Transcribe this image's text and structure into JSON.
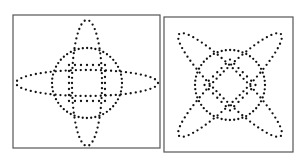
{
  "figure": {
    "panels": [
      {
        "id": "left",
        "description": "dotted circle with inner dotted square, crossed by horizontal and vertical dotted ellipses",
        "frame": {
          "x": 13,
          "y": 15,
          "w": 147,
          "h": 133
        },
        "center": [
          87,
          83
        ],
        "shapes": {
          "circle_r": 35,
          "vertical_ellipse": {
            "rx": 15,
            "ry": 63,
            "angle": 0
          },
          "horizontal_ellipse": {
            "rx": 71,
            "ry": 13,
            "angle": 0
          },
          "inner_square_half": 18
        }
      },
      {
        "id": "right",
        "description": "dotted circle with inner diagonal dotted lines, crossed by two diagonal dotted ellipses",
        "frame": {
          "x": 164,
          "y": 17,
          "w": 129,
          "h": 135
        },
        "center": [
          230,
          85
        ],
        "shapes": {
          "circle_r": 35,
          "diag_ellipse_a": {
            "rx": 72,
            "ry": 14,
            "angle": 45
          },
          "diag_ellipse_b": {
            "rx": 72,
            "ry": 14,
            "angle": -45
          },
          "inner_square_half": 18,
          "inner_square_angle": 45
        }
      }
    ],
    "colors": {
      "frame": "#555555",
      "dots": "#111111",
      "background": "#ffffff"
    }
  }
}
